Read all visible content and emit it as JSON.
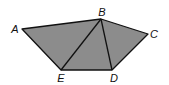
{
  "diagram": {
    "type": "pentagon-triangulation",
    "fill_color": "#8c8c8c",
    "stroke_color": "#111111",
    "vertices": [
      {
        "label": "A",
        "x": 22,
        "y": 29,
        "lx": 15,
        "ly": 33
      },
      {
        "label": "B",
        "x": 101,
        "y": 19,
        "lx": 102,
        "ly": 16
      },
      {
        "label": "C",
        "x": 148,
        "y": 34,
        "lx": 154,
        "ly": 38
      },
      {
        "label": "D",
        "x": 112,
        "y": 70,
        "lx": 114,
        "ly": 82
      },
      {
        "label": "E",
        "x": 61,
        "y": 70,
        "lx": 61,
        "ly": 82
      }
    ],
    "diagonals": [
      [
        "B",
        "E"
      ],
      [
        "B",
        "D"
      ]
    ]
  }
}
